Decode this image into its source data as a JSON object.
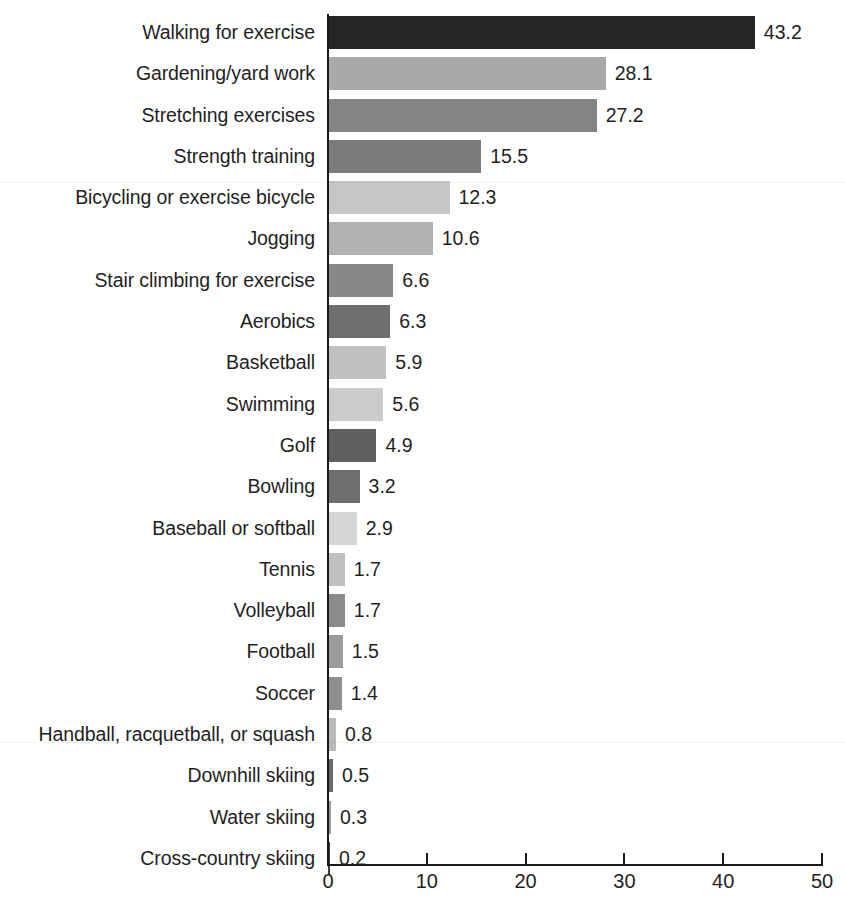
{
  "chart_data": {
    "type": "bar",
    "orientation": "horizontal",
    "title": "",
    "subtitle": "",
    "xlabel": "",
    "ylabel": "",
    "xlim": [
      0,
      50
    ],
    "xticks": [
      0,
      10,
      20,
      30,
      40,
      50
    ],
    "xtick_labels": [
      "0",
      "10",
      "20",
      "30",
      "40",
      "50"
    ],
    "grid": false,
    "legend": false,
    "value_labels_shown": true,
    "categories": [
      "Walking for exercise",
      "Gardening/yard work",
      "Stretching exercises",
      "Strength training",
      "Bicycling or exercise bicycle",
      "Jogging",
      "Stair climbing for exercise",
      "Aerobics",
      "Basketball",
      "Swimming",
      "Golf",
      "Bowling",
      "Baseball or softball",
      "Tennis",
      "Volleyball",
      "Football",
      "Soccer",
      "Handball, racquetball, or squash",
      "Downhill skiing",
      "Water skiing",
      "Cross-country skiing"
    ],
    "values": [
      43.2,
      28.1,
      27.2,
      15.5,
      12.3,
      10.6,
      6.6,
      6.3,
      5.9,
      5.6,
      4.9,
      3.2,
      2.9,
      1.7,
      1.7,
      1.5,
      1.4,
      0.8,
      0.5,
      0.3,
      0.2
    ],
    "value_label_texts": [
      "43.2",
      "28.1",
      "27.2",
      "15.5",
      "12.3",
      "10.6",
      "6.6",
      "6.3",
      "5.9",
      "5.6",
      "4.9",
      "3.2",
      "2.9",
      "1.7",
      "1.7",
      "1.5",
      "1.4",
      "0.8",
      "0.5",
      "0.3",
      "0.2"
    ],
    "bar_colors": [
      "#262626",
      "#a9a9a9",
      "#848484",
      "#7b7b7b",
      "#c6c6c6",
      "#b1b1b1",
      "#888888",
      "#6f6f6f",
      "#c0c0c0",
      "#cbcbcb",
      "#606060",
      "#6f6f6f",
      "#d6d6d6",
      "#c0c0c0",
      "#8b8b8b",
      "#9b9b9b",
      "#8f8f8f",
      "#b9b9b9",
      "#6b6b6b",
      "#9b9b9b",
      "#3b3b3b"
    ]
  },
  "axis": {
    "line_color": "#1a1a1a",
    "tick_count": 6
  }
}
